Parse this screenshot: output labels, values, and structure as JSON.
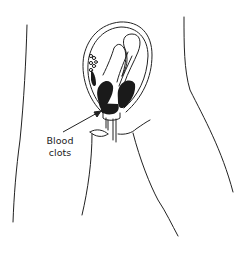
{
  "diagram": {
    "labels": [
      {
        "text_line1": "Blood",
        "text_line2": "clots"
      }
    ],
    "colors": {
      "ink": "#222222",
      "fill": "#1a1a1a",
      "background": "#ffffff"
    }
  }
}
